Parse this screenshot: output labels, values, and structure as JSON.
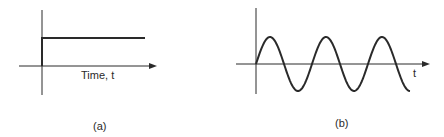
{
  "figures": [
    {
      "id": "a",
      "caption": "(a)",
      "type": "step-function",
      "x_axis_label": "Time, t",
      "description": "Unit step: zero before t=0, constant positive value after"
    },
    {
      "id": "b",
      "caption": "(b)",
      "type": "sine-wave",
      "x_axis_label": "t",
      "cycles_shown": 2.75,
      "description": "Sinusoid starting at zero at t=0, rising to positive peak"
    }
  ],
  "colors": {
    "stroke": "#2a2a2a",
    "background": "#ffffff"
  }
}
